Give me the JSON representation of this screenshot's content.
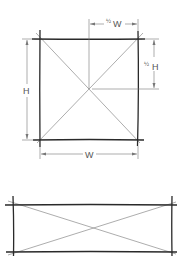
{
  "diagram": {
    "title": "",
    "colors": {
      "frame": "#2a2a2a",
      "diagonal": "#8a8a8a",
      "dimension": "#777777",
      "text": "#555555"
    },
    "square": {
      "labels": {
        "height": "H",
        "width": "W",
        "half_width_frac": "½",
        "half_width_var": "W",
        "half_height_frac": "½",
        "half_height_var": "H"
      }
    },
    "rectangle": {}
  }
}
